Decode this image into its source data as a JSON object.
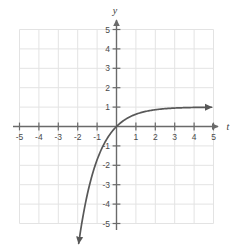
{
  "figure": {
    "name": "exponential-growth-graph",
    "background_color": "#ffffff",
    "grid_color": "#e3e3e3",
    "axis_color": "#6a6a6a",
    "curve_color": "#585858",
    "label_color": "#4a4a4a"
  },
  "axes": {
    "x_axis_label": "t",
    "y_axis_label": "y",
    "x_ticks": [
      "-5",
      "-4",
      "-3",
      "-2",
      "-1",
      "1",
      "2",
      "3",
      "4",
      "5"
    ],
    "y_ticks": [
      "5",
      "4",
      "3",
      "2",
      "1",
      "-1",
      "-2",
      "-3",
      "-4",
      "-5"
    ],
    "x_tick_values": [
      -5,
      -4,
      -3,
      -2,
      -1,
      1,
      2,
      3,
      4,
      5
    ],
    "y_tick_values": [
      5,
      4,
      3,
      2,
      1,
      -1,
      -2,
      -3,
      -4,
      -5
    ],
    "origin_label": "",
    "x_arrow": "right-arrowhead",
    "y_arrow": "up-arrowhead"
  },
  "chart_data": {
    "type": "line",
    "title": "",
    "subtitle": "",
    "xlabel": "t",
    "ylabel": "y",
    "xlim": [
      -5,
      5
    ],
    "ylim": [
      -5,
      5
    ],
    "grid": true,
    "legend": false,
    "legend_position": "none",
    "annotations": [
      "curve passes through the origin (0, 0)",
      "horizontal asymptote at y = 1 as t increases",
      "curve falls steeply toward lower-left, arrow near t = -2.6, y = -5.9"
    ],
    "series": [
      {
        "name": "y = 1 - e^(-t)",
        "start_arrow": true,
        "end_arrow": true,
        "x": [
          -2.6,
          -2.4,
          -2.2,
          -2.0,
          -1.8,
          -1.6,
          -1.4,
          -1.2,
          -1.0,
          -0.8,
          -0.6,
          -0.4,
          -0.2,
          0.0,
          0.25,
          0.5,
          0.75,
          1.0,
          1.5,
          2.0,
          2.5,
          3.0,
          3.5,
          4.0,
          4.5,
          5.0
        ],
        "y": [
          -12.46,
          -10.02,
          -8.03,
          -6.39,
          -5.05,
          -3.95,
          -3.06,
          -2.32,
          -1.72,
          -1.23,
          -0.82,
          -0.49,
          -0.22,
          0.0,
          0.22,
          0.39,
          0.53,
          0.63,
          0.78,
          0.86,
          0.92,
          0.95,
          0.97,
          0.98,
          0.99,
          0.99
        ]
      }
    ]
  }
}
